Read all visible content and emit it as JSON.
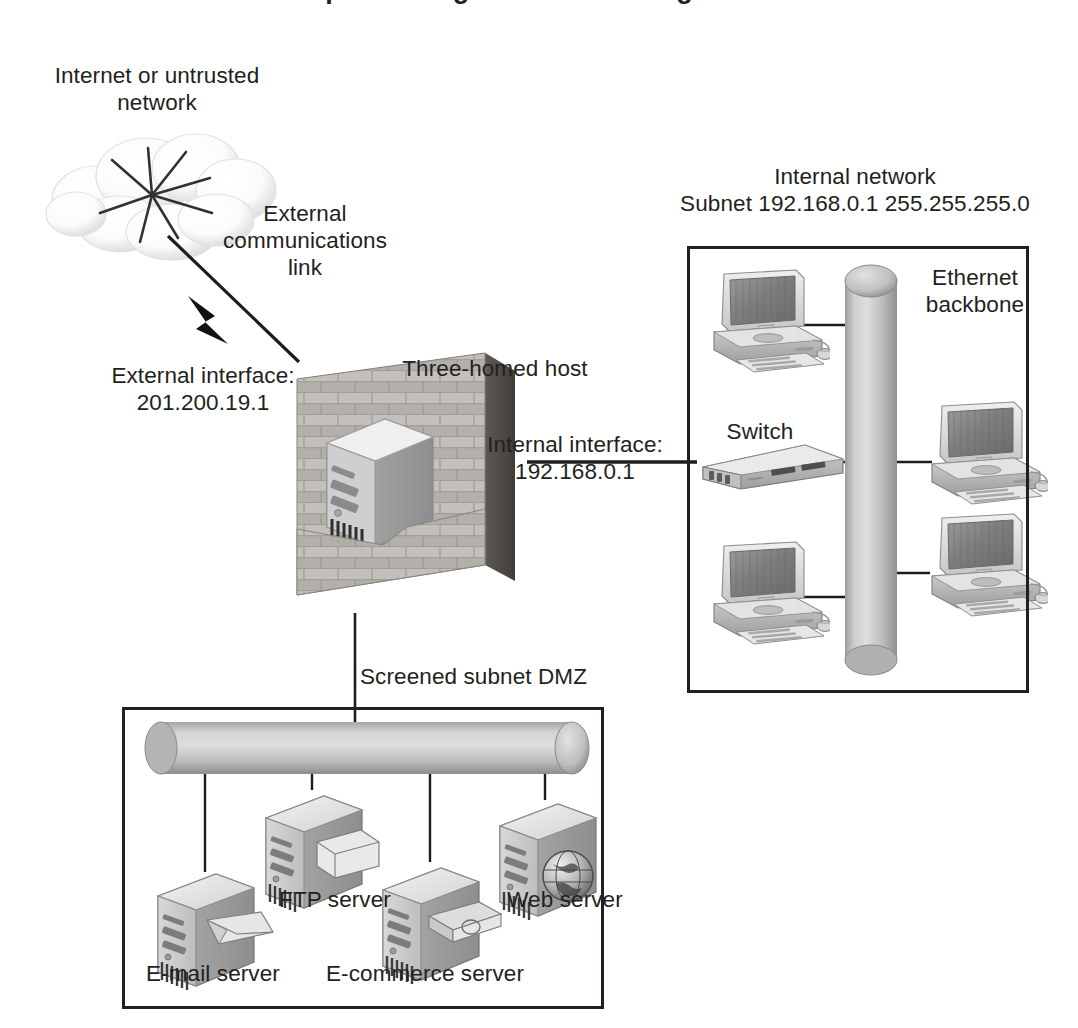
{
  "diagram": {
    "top_heading_partial": "Implementing a Firewall Configuration",
    "ink_color": "#231f20",
    "device_light": "#e9e9e9",
    "device_mid": "#b5b5b5",
    "device_dark": "#8a8a8a"
  },
  "cloud": {
    "label": "Internet or untrusted\nnetwork",
    "icon": "cloud-icon",
    "starburst_rays": 8
  },
  "external_link": {
    "label": "External\ncommunications\nlink",
    "icon": "lightning-bolt-icon"
  },
  "external_interface": {
    "label": "External interface:",
    "address": "201.200.19.1"
  },
  "firewall": {
    "label": "Three-homed host",
    "icon": "brick-wall-icon",
    "server_icon": "tower-server-icon"
  },
  "internal_interface": {
    "label": "Internal interface:",
    "address": "192.168.0.1"
  },
  "internal_network": {
    "title": "Internal network",
    "subnet": "Subnet 192.168.0.1 255.255.255.0",
    "backbone_label": "Ethernet\nbackbone",
    "backbone_icon": "cylinder-backbone-icon",
    "switch_label": "Switch",
    "switch_icon": "network-switch-icon",
    "workstations": [
      {
        "name": "workstation-top-left",
        "icon": "desktop-computer-icon"
      },
      {
        "name": "workstation-top-right",
        "icon": "desktop-computer-icon"
      },
      {
        "name": "workstation-bottom-left",
        "icon": "desktop-computer-icon"
      },
      {
        "name": "workstation-bottom-right",
        "icon": "desktop-computer-icon"
      }
    ]
  },
  "dmz": {
    "title": "Screened subnet DMZ",
    "backbone_icon": "cylinder-backbone-icon",
    "servers": [
      {
        "label": "E-mail server",
        "icon": "envelope-icon",
        "name": "email-server"
      },
      {
        "label": "FTP server",
        "icon": "file-card-icon",
        "name": "ftp-server"
      },
      {
        "label": "E-commerce server",
        "icon": "credit-card-icon",
        "name": "ecommerce-server"
      },
      {
        "label": "Web server",
        "icon": "globe-icon",
        "name": "web-server"
      }
    ]
  }
}
